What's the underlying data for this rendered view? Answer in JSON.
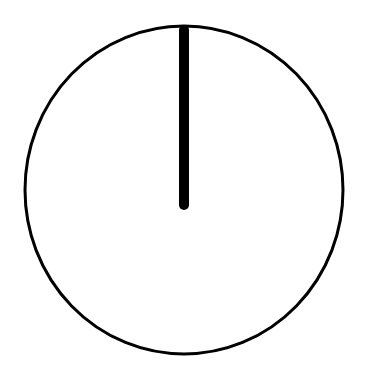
{
  "diagram": {
    "description": "Circle with a single vertical hand from center to top (12 o'clock)",
    "colors": {
      "stroke": "#000000",
      "background": "#ffffff"
    },
    "circle": {
      "cx": 184,
      "cy": 190,
      "rx": 159,
      "ry": 164,
      "stroke_width": 3
    },
    "hand": {
      "x": 184,
      "y1": 30,
      "y2": 205,
      "width": 10,
      "direction": "12 o'clock"
    }
  }
}
